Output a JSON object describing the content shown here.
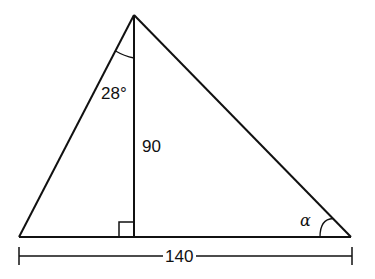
{
  "diagram": {
    "type": "right-triangle-with-altitude",
    "points": {
      "apex": [
        134,
        15
      ],
      "left_base": [
        19,
        237
      ],
      "right_base": [
        351,
        237
      ],
      "foot": [
        134,
        237
      ]
    },
    "labels": {
      "apex_angle": "28°",
      "altitude": "90",
      "base_length": "140",
      "base_angle": "α"
    },
    "stroke_color": "#111111",
    "background": "#ffffff"
  }
}
